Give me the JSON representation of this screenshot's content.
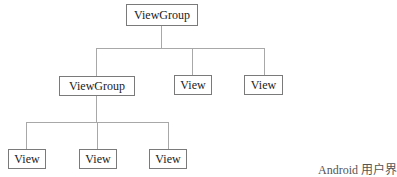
{
  "diagram": {
    "type": "tree",
    "nodes": {
      "root": {
        "label": "ViewGroup"
      },
      "child_group": {
        "label": "ViewGroup"
      },
      "child_view_1": {
        "label": "View"
      },
      "child_view_2": {
        "label": "View"
      },
      "leaf_view_1": {
        "label": "View"
      },
      "leaf_view_2": {
        "label": "View"
      },
      "leaf_view_3": {
        "label": "View"
      }
    },
    "edges": [
      [
        "root",
        "child_group"
      ],
      [
        "root",
        "child_view_1"
      ],
      [
        "root",
        "child_view_2"
      ],
      [
        "child_group",
        "leaf_view_1"
      ],
      [
        "child_group",
        "leaf_view_2"
      ],
      [
        "child_group",
        "leaf_view_3"
      ]
    ],
    "caption": "Android 用户界"
  },
  "colors": {
    "border": "#7a7a7a",
    "connector": "#a8a8a8",
    "text": "#222222"
  }
}
